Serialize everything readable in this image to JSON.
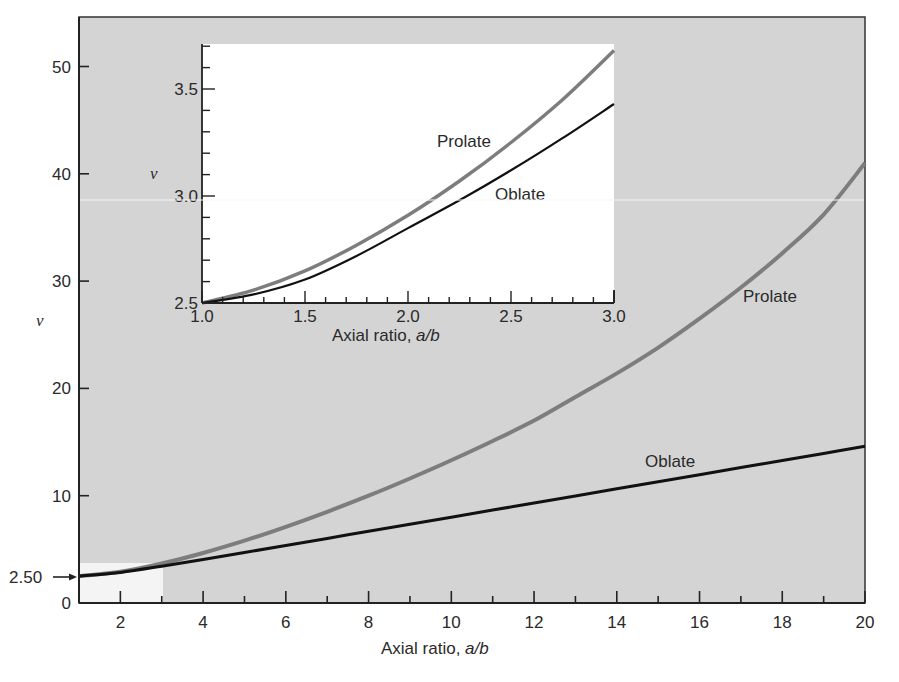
{
  "chart_data": [
    {
      "id": "main",
      "type": "line",
      "title": "",
      "xlabel": "Axial ratio, a/b",
      "ylabel": "v",
      "xlim": [
        1,
        20
      ],
      "ylim": [
        0,
        53
      ],
      "xticks": [
        2,
        4,
        6,
        8,
        10,
        12,
        14,
        16,
        18,
        20
      ],
      "yticks": [
        0,
        10,
        20,
        30,
        40,
        50
      ],
      "grid": false,
      "background": "#d4d4d4",
      "annotation": {
        "text": "2.50",
        "arrow_to_y": 2.5,
        "highlight_box": {
          "x": [
            1,
            3
          ],
          "y": [
            2.5,
            3.7
          ]
        }
      },
      "series": [
        {
          "name": "Prolate",
          "color": "#7d7d7d",
          "x": [
            1,
            2,
            3,
            4,
            5,
            6,
            7,
            8,
            9,
            10,
            11,
            12,
            13,
            14,
            15,
            16,
            17,
            18,
            19,
            20
          ],
          "values": [
            2.5,
            2.91,
            3.68,
            4.66,
            5.81,
            7.1,
            8.5,
            10.0,
            11.6,
            13.3,
            15.1,
            17.0,
            19.2,
            21.4,
            23.8,
            26.5,
            29.4,
            32.6,
            36.2,
            41.0
          ]
        },
        {
          "name": "Oblate",
          "color": "#111111",
          "x": [
            1,
            2,
            3,
            4,
            5,
            6,
            7,
            8,
            9,
            10,
            11,
            12,
            13,
            14,
            15,
            16,
            17,
            18,
            19,
            20
          ],
          "values": [
            2.5,
            2.85,
            3.43,
            4.06,
            4.71,
            5.36,
            6.02,
            6.68,
            7.34,
            8.0,
            8.66,
            9.32,
            9.98,
            10.64,
            11.3,
            11.96,
            12.62,
            13.28,
            13.94,
            14.6
          ]
        }
      ]
    },
    {
      "id": "inset",
      "type": "line",
      "title": "",
      "xlabel": "Axial ratio, a/b",
      "ylabel": "v",
      "xlim": [
        1.0,
        3.0
      ],
      "ylim": [
        2.5,
        3.72
      ],
      "xticks": [
        1.0,
        1.5,
        2.0,
        2.5,
        3.0
      ],
      "yticks": [
        2.5,
        3.0,
        3.5
      ],
      "grid": false,
      "background": "#ffffff",
      "series": [
        {
          "name": "Prolate",
          "color": "#7d7d7d",
          "x": [
            1.0,
            1.25,
            1.5,
            1.75,
            2.0,
            2.25,
            2.5,
            2.75,
            3.0
          ],
          "values": [
            2.5,
            2.56,
            2.65,
            2.77,
            2.91,
            3.07,
            3.25,
            3.45,
            3.68
          ]
        },
        {
          "name": "Oblate",
          "color": "#111111",
          "x": [
            1.0,
            1.25,
            1.5,
            1.75,
            2.0,
            2.25,
            2.5,
            2.75,
            3.0
          ],
          "values": [
            2.5,
            2.54,
            2.61,
            2.72,
            2.85,
            2.98,
            3.12,
            3.27,
            3.43
          ]
        }
      ]
    }
  ],
  "main": {
    "xlabel_prefix": "Axial ratio, ",
    "xlabel_var": "a/b",
    "ylabel": "v",
    "annotation_value": "2.50",
    "x_tick_labels": [
      "2",
      "4",
      "6",
      "8",
      "10",
      "12",
      "14",
      "16",
      "18",
      "20"
    ],
    "y_tick_labels": [
      "0",
      "10",
      "20",
      "30",
      "40",
      "50"
    ],
    "labels": {
      "prolate": "Prolate",
      "oblate": "Oblate"
    }
  },
  "inset": {
    "xlabel_prefix": "Axial ratio, ",
    "xlabel_var": "a/b",
    "ylabel": "v",
    "x_tick_labels": [
      "1.0",
      "1.5",
      "2.0",
      "2.5",
      "3.0"
    ],
    "y_tick_labels": [
      "2.5",
      "3.0",
      "3.5"
    ],
    "labels": {
      "prolate": "Prolate",
      "oblate": "Oblate"
    }
  },
  "colors": {
    "panel_bg": "#d4d4d4",
    "prolate": "#7d7d7d",
    "oblate": "#111111",
    "axis": "#222222"
  }
}
